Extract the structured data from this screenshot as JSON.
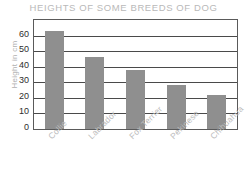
{
  "chart_data": {
    "type": "bar",
    "title": "HEIGHTS OF SOME BREEDS OF DOG",
    "xlabel": "",
    "ylabel": "Height in cm",
    "categories": [
      "Collie",
      "Labrador",
      "Fox Terrier",
      "Pekinese",
      "Chihuahua"
    ],
    "values": [
      63,
      46,
      38,
      28,
      22
    ],
    "ylim": [
      0,
      70
    ],
    "yticks": [
      0,
      10,
      20,
      30,
      40,
      50,
      60
    ],
    "ytick_labels": [
      "0",
      "10",
      "20",
      "30",
      "40",
      "50",
      "60"
    ],
    "grid": true,
    "legend": false,
    "bar_color": "#8f8f8f",
    "title_color": "#b9b9b9",
    "axis_label_color": "#b0b0b0",
    "tick_color": "#2e2e2e",
    "frame_color": "#5a5a5a"
  }
}
